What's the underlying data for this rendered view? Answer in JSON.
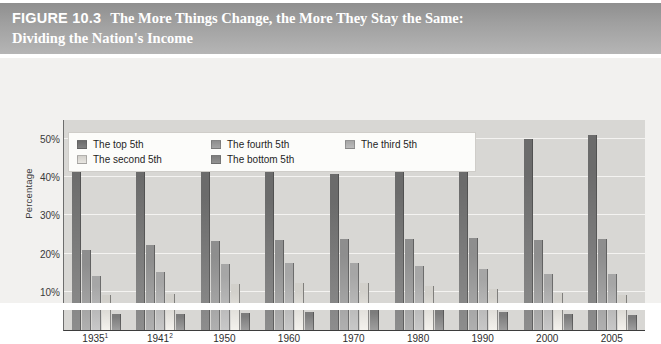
{
  "figure": {
    "label": "FIGURE 10.3",
    "title": "The More Things Change, the More They Stay the Same:",
    "subtitle": "Dividing the Nation's Income"
  },
  "colors": {
    "band_dark": "#8f8f8f",
    "band_light": "#b5b5b5",
    "plot_background": "#d8d7d4",
    "chart_background": "#f2f1ef",
    "gridline": "#f4f3f1",
    "axis": "#3d3d3d",
    "legend_background": "#fcfcfa",
    "top_5th": "#6b6b6b",
    "fourth_5th": "#8e8e8e",
    "third_5th": "#a6a6a6",
    "second_5th": "#d2d0cb",
    "bottom_5th": "#7c7c7c"
  },
  "legend": {
    "items": [
      {
        "label": "The top 5th",
        "color": "#6b6b6b",
        "swatch": "legend-swatch-top-5th"
      },
      {
        "label": "The fourth 5th",
        "color": "#8e8e8e",
        "swatch": "legend-swatch-fourth-5th"
      },
      {
        "label": "The third 5th",
        "color": "#a6a6a6",
        "swatch": "legend-swatch-third-5th"
      },
      {
        "label": "The second 5th",
        "color": "#d2d0cb",
        "swatch": "legend-swatch-second-5th"
      },
      {
        "label": "The bottom 5th",
        "color": "#7c7c7c",
        "swatch": "legend-swatch-bottom-5th"
      }
    ]
  },
  "chart_data": {
    "type": "bar",
    "title": "The More Things Change, the More They Stay the Same: Dividing the Nation's Income",
    "xlabel": "",
    "ylabel": "Percentage",
    "categories": [
      "1935¹",
      "1941²",
      "1950",
      "1960",
      "1970",
      "1980",
      "1990",
      "2000",
      "2005"
    ],
    "categories_plain": [
      "1935",
      "1941",
      "1950",
      "1960",
      "1970",
      "1980",
      "1990",
      "2000",
      "2005"
    ],
    "footnotes": [
      "1",
      "2"
    ],
    "ylim": [
      0,
      55
    ],
    "yticks": [
      10,
      20,
      30,
      40,
      50
    ],
    "ytick_labels": [
      "10%",
      "20%",
      "30%",
      "40%",
      "50%"
    ],
    "grid": true,
    "legend_position": "top-left-inside",
    "series": [
      {
        "name": "The top 5th",
        "color": "#6b6b6b",
        "values": [
          51.7,
          48.8,
          42.7,
          42.0,
          40.9,
          44.1,
          46.6,
          50.1,
          51.0
        ]
      },
      {
        "name": "The fourth 5th",
        "color": "#8e8e8e",
        "values": [
          20.9,
          22.3,
          23.4,
          23.6,
          23.8,
          23.9,
          24.0,
          23.6,
          23.9
        ]
      },
      {
        "name": "The third 5th",
        "color": "#a6a6a6",
        "values": [
          14.1,
          15.3,
          17.4,
          17.6,
          17.6,
          16.8,
          15.9,
          14.8,
          14.6
        ]
      },
      {
        "name": "The second 5th",
        "color": "#d2d0cb",
        "values": [
          9.2,
          9.5,
          12.0,
          12.2,
          12.2,
          11.6,
          10.8,
          9.6,
          9.3
        ]
      },
      {
        "name": "The bottom 5th",
        "color": "#7c7c7c",
        "values": [
          4.1,
          4.1,
          4.5,
          4.6,
          5.4,
          5.2,
          4.6,
          4.3,
          4.0
        ]
      }
    ]
  }
}
